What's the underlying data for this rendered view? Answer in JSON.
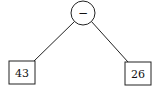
{
  "diagram": {
    "type": "expression-tree",
    "root": {
      "label": "−",
      "shape": "circle"
    },
    "children": [
      {
        "label": "43",
        "shape": "square",
        "position": "left"
      },
      {
        "label": "26",
        "shape": "square",
        "position": "right"
      }
    ]
  },
  "colors": {
    "stroke": "#222222",
    "background": "#ffffff"
  }
}
